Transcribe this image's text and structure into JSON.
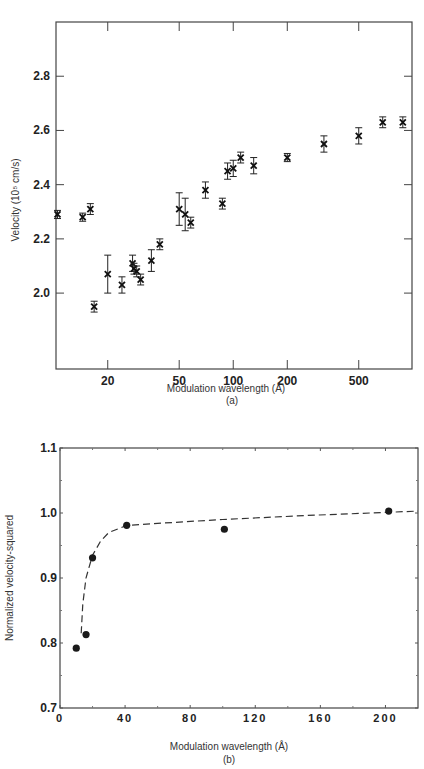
{
  "header": {
    "text": ""
  },
  "chart_data": [
    {
      "panel": "(a)",
      "type": "scatter",
      "title": "",
      "xlabel": "Modulation wavelength (Å)",
      "ylabel": "Velocity (10⁵ cm/s)",
      "caption": "(a)",
      "xscale": "log",
      "xlim": [
        10.3,
        990
      ],
      "ylim": [
        1.72,
        3.0
      ],
      "xticks": [
        20,
        50,
        100,
        200,
        500
      ],
      "xtick_labels": [
        "20",
        "50",
        "100",
        "200",
        "500"
      ],
      "yticks": [
        2.0,
        2.2,
        2.4,
        2.6,
        2.8
      ],
      "ytick_labels": [
        "2.0",
        "2.2",
        "2.4",
        "2.6",
        "2.8"
      ],
      "grid": false,
      "marker": "x with error bars",
      "series": [
        {
          "name": "measured velocity",
          "points": [
            {
              "x": 10.5,
              "y": 2.29,
              "err": 0.015
            },
            {
              "x": 14.5,
              "y": 2.28,
              "err": 0.015
            },
            {
              "x": 16.0,
              "y": 2.31,
              "err": 0.02
            },
            {
              "x": 16.8,
              "y": 1.95,
              "err": 0.02
            },
            {
              "x": 20.0,
              "y": 2.07,
              "err": 0.07
            },
            {
              "x": 24.0,
              "y": 2.03,
              "err": 0.03
            },
            {
              "x": 27.5,
              "y": 2.11,
              "err": 0.03
            },
            {
              "x": 28.0,
              "y": 2.09,
              "err": 0.02
            },
            {
              "x": 29.0,
              "y": 2.08,
              "err": 0.02
            },
            {
              "x": 30.5,
              "y": 2.05,
              "err": 0.02
            },
            {
              "x": 35.0,
              "y": 2.12,
              "err": 0.04
            },
            {
              "x": 39.0,
              "y": 2.18,
              "err": 0.02
            },
            {
              "x": 50.0,
              "y": 2.31,
              "err": 0.06
            },
            {
              "x": 54.0,
              "y": 2.29,
              "err": 0.06
            },
            {
              "x": 58.0,
              "y": 2.26,
              "err": 0.02
            },
            {
              "x": 70.0,
              "y": 2.38,
              "err": 0.03
            },
            {
              "x": 87.0,
              "y": 2.33,
              "err": 0.02
            },
            {
              "x": 93.0,
              "y": 2.45,
              "err": 0.03
            },
            {
              "x": 100.0,
              "y": 2.46,
              "err": 0.03
            },
            {
              "x": 110.0,
              "y": 2.5,
              "err": 0.02
            },
            {
              "x": 130.0,
              "y": 2.47,
              "err": 0.03
            },
            {
              "x": 200.0,
              "y": 2.5,
              "err": 0.015
            },
            {
              "x": 320.0,
              "y": 2.55,
              "err": 0.03
            },
            {
              "x": 500.0,
              "y": 2.58,
              "err": 0.03
            },
            {
              "x": 680.0,
              "y": 2.63,
              "err": 0.02
            },
            {
              "x": 880.0,
              "y": 2.63,
              "err": 0.02
            }
          ]
        }
      ]
    },
    {
      "panel": "(b)",
      "type": "scatter",
      "title": "",
      "xlabel": "Modulation wavelength (Å)",
      "ylabel": "Normalized velocity-squared",
      "caption": "(b)",
      "xscale": "linear",
      "xlim": [
        0,
        220
      ],
      "ylim": [
        0.7,
        1.1
      ],
      "xticks": [
        0,
        40,
        80,
        120,
        160,
        200
      ],
      "xtick_labels": [
        "0",
        "40",
        "80",
        "120",
        "160",
        "200"
      ],
      "yticks": [
        0.7,
        0.8,
        0.9,
        1.0,
        1.1
      ],
      "ytick_labels": [
        "0.7",
        "0.8",
        "0.9",
        "1.0",
        "1.1"
      ],
      "grid": false,
      "series": [
        {
          "name": "measured",
          "marker": "filled circle",
          "points": [
            {
              "x": 10,
              "y": 0.792
            },
            {
              "x": 16,
              "y": 0.813
            },
            {
              "x": 20,
              "y": 0.931
            },
            {
              "x": 41,
              "y": 0.981
            },
            {
              "x": 101,
              "y": 0.975
            },
            {
              "x": 202,
              "y": 1.003
            }
          ]
        },
        {
          "name": "fit",
          "style": "dashed line",
          "points": [
            {
              "x": 13,
              "y": 0.815
            },
            {
              "x": 14,
              "y": 0.86
            },
            {
              "x": 16,
              "y": 0.9
            },
            {
              "x": 20,
              "y": 0.935
            },
            {
              "x": 25,
              "y": 0.957
            },
            {
              "x": 30,
              "y": 0.97
            },
            {
              "x": 41,
              "y": 0.981
            },
            {
              "x": 60,
              "y": 0.984
            },
            {
              "x": 100,
              "y": 0.99
            },
            {
              "x": 150,
              "y": 0.996
            },
            {
              "x": 200,
              "y": 1.001
            },
            {
              "x": 220,
              "y": 1.003
            }
          ]
        }
      ]
    }
  ]
}
